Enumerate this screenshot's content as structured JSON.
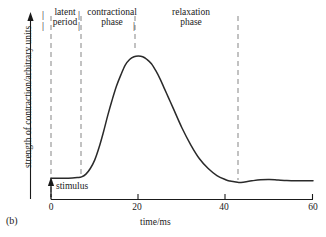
{
  "figure": {
    "panel_label": "(b)",
    "y_axis_label": "strength of contraction/arbitrary units",
    "x_axis_label": "time/ms",
    "stimulus_label": "stimulus",
    "separator_glyph": "|"
  },
  "annotations": {
    "latent_period": "latent\nperiod",
    "latent_period_line1": "latent",
    "latent_period_line2": "period",
    "contractional_phase_line1": "contractional",
    "contractional_phase_line2": "phase",
    "relaxation_phase_line1": "relaxation",
    "relaxation_phase_line2": "phase"
  },
  "colors": {
    "curve": "#1a1a1a",
    "axis": "#1a1a1a",
    "dashed_guide": "#9a9a9a",
    "background": "#ffffff"
  },
  "chart_data": {
    "type": "line",
    "title": "",
    "xlabel": "time/ms",
    "ylabel": "strength of contraction/arbitrary units",
    "xlim": [
      0,
      60
    ],
    "ylim": [
      0,
      1.0
    ],
    "xticks": [
      0,
      20,
      40,
      60
    ],
    "xtick_labels": [
      "0",
      "20",
      "40",
      "60"
    ],
    "yticks": [],
    "ytick_labels": [],
    "grid": false,
    "legend": false,
    "series": [
      {
        "name": "muscle twitch",
        "x": [
          0,
          2,
          4,
          6,
          7,
          8,
          9,
          10,
          11,
          12,
          13,
          14,
          15,
          16,
          17,
          18,
          19,
          20,
          21,
          22,
          23,
          24,
          25,
          26,
          27,
          28,
          30,
          32,
          34,
          36,
          38,
          40,
          41,
          42,
          43,
          44,
          46,
          48,
          50,
          52,
          54,
          56,
          58,
          60
        ],
        "y": [
          0.04,
          0.04,
          0.04,
          0.045,
          0.05,
          0.07,
          0.11,
          0.17,
          0.26,
          0.37,
          0.49,
          0.6,
          0.7,
          0.78,
          0.85,
          0.89,
          0.91,
          0.915,
          0.91,
          0.89,
          0.86,
          0.81,
          0.75,
          0.68,
          0.61,
          0.54,
          0.4,
          0.28,
          0.18,
          0.11,
          0.06,
          0.03,
          0.02,
          0.015,
          0.01,
          0.012,
          0.022,
          0.03,
          0.032,
          0.028,
          0.024,
          0.022,
          0.022,
          0.022
        ]
      }
    ],
    "markers": [
      {
        "name": "stimulus",
        "x": 0,
        "label": "stimulus",
        "type": "up-arrow"
      }
    ],
    "guides": [
      {
        "name": "stimulus-guide",
        "x": 0,
        "style": "dashed",
        "full_height": true
      },
      {
        "name": "latent-end-guide",
        "x": 7,
        "style": "dashed",
        "full_height": true
      },
      {
        "name": "peak-guide",
        "x": 19,
        "style": "dashed",
        "full_height": false
      },
      {
        "name": "relaxation-end-guide",
        "x": 43,
        "style": "dashed",
        "full_height": true
      }
    ],
    "phases": [
      {
        "name": "latent period",
        "x_start": 0,
        "x_end": 7
      },
      {
        "name": "contractional phase",
        "x_start": 7,
        "x_end": 19
      },
      {
        "name": "relaxation phase",
        "x_start": 19,
        "x_end": 43
      }
    ]
  }
}
